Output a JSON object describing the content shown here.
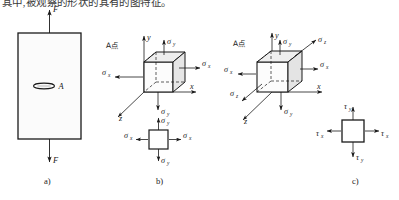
{
  "page": {
    "top_text_clipped": "其中,被观察的形状的其有的图特征。",
    "background": "#ffffff",
    "ink": "#1a1a1a"
  },
  "panels": [
    {
      "key": "a",
      "caption": "a)",
      "description": "tensile-bar",
      "labels": {
        "force_top": "F",
        "force_bottom": "F",
        "point": "A"
      }
    },
    {
      "key": "b",
      "caption": "b)",
      "description": "stress-element-plane",
      "labels": {
        "point_note": "A点",
        "axis_x": "x",
        "axis_y": "y",
        "axis_z": "z",
        "sigma_x_left": "σ",
        "sigma_x_left_sub": "x",
        "sigma_x_right": "σ",
        "sigma_x_right_sub": "x",
        "sigma_y_top": "σ",
        "sigma_y_top_sub": "y",
        "sigma_y_bottom": "σ",
        "sigma_y_bottom_sub": "y",
        "square_sigma_x_left": "σ",
        "square_sigma_x_left_sub": "x",
        "square_sigma_x_right": "σ",
        "square_sigma_x_right_sub": "x",
        "square_sigma_y_top": "σ",
        "square_sigma_y_top_sub": "y",
        "square_sigma_y_bottom": "σ",
        "square_sigma_y_bottom_sub": "y"
      }
    },
    {
      "key": "c",
      "caption": "c)",
      "description": "stress-element-triaxial",
      "labels": {
        "point_note": "A点",
        "axis_x": "x",
        "axis_y": "y",
        "axis_z": "z",
        "sigma_x_left": "σ",
        "sigma_x_left_sub": "x",
        "sigma_x_right": "σ",
        "sigma_x_right_sub": "x",
        "sigma_y_top": "σ",
        "sigma_y_top_sub": "y",
        "sigma_y_bottom": "σ",
        "sigma_y_bottom_sub": "y",
        "sigma_z_front": "σ",
        "sigma_z_front_sub": "z",
        "sigma_z_back": "σ",
        "sigma_z_back_sub": "z",
        "square_tau_x_left": "τ",
        "square_tau_x_left_sub": "x",
        "square_tau_x_right": "τ",
        "square_tau_x_right_sub": "x",
        "square_tau_y_top": "τ",
        "square_tau_y_top_sub": "y",
        "square_tau_y_bottom": "τ",
        "square_tau_y_bottom_sub": "y"
      }
    }
  ],
  "style": {
    "stroke": "#1a1a1a",
    "face_fill": "#f7f7f7",
    "shade_fill": "#e3e3e3",
    "dash": "3,2"
  }
}
